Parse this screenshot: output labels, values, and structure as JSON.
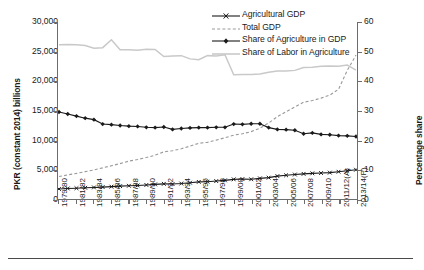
{
  "chart_data": {
    "type": "line",
    "title": "",
    "xlabel": "",
    "ylabel": "PKR (constant 2014) billions",
    "ylabel_right": "Percentage share",
    "ylim": [
      0,
      30000
    ],
    "ylim_right": [
      0,
      60
    ],
    "yticks": [
      "0",
      "5,000",
      "10,000",
      "15,000",
      "20,000",
      "25,000",
      "30,000"
    ],
    "ytick_values": [
      0,
      5000,
      10000,
      15000,
      20000,
      25000,
      30000
    ],
    "yticks_right": [
      "0",
      "10",
      "20",
      "30",
      "40",
      "50",
      "60"
    ],
    "ytick_values_right": [
      0,
      10,
      20,
      30,
      40,
      50,
      60
    ],
    "grid": false,
    "legend_position": "top-right",
    "categories": [
      "1979/80",
      "1980/81",
      "1981/82",
      "1982/83",
      "1983/84",
      "1984/85",
      "1985/86",
      "1986/87",
      "1987/88",
      "1988/89",
      "1989/90",
      "1990/91",
      "1991/92",
      "1992/93",
      "1993/94",
      "1994/95",
      "1995/96",
      "1996/97",
      "1997/98",
      "1998/99",
      "1999/00",
      "2000/01",
      "2001/02",
      "2002/03",
      "2003/04",
      "2004/05",
      "2005/06",
      "2006/07",
      "2007/08",
      "2008/09",
      "2009/10",
      "2010/11",
      "2011/12(A)",
      "2012/13",
      "2013/14(P)"
    ],
    "xtick_labels": [
      "1979/80",
      "1981/82",
      "1983/84",
      "1985/86",
      "1987/88",
      "1989/90",
      "1991/92",
      "1993/94",
      "1995/96",
      "1997/98",
      "1999/00",
      "2001/02",
      "2003/04",
      "2005/06",
      "2007/08",
      "2009/10",
      "2011/12(A)",
      "2013/14(P)"
    ],
    "series": [
      {
        "name": "Agricultural GDP",
        "axis": "left",
        "style": "solid-marker-x",
        "color": "#1a1a1a",
        "values": [
          1700,
          1790,
          1830,
          1900,
          1960,
          2020,
          2090,
          2180,
          2240,
          2300,
          2380,
          2480,
          2570,
          2530,
          2620,
          2760,
          2900,
          2930,
          3040,
          3160,
          3330,
          3380,
          3340,
          3500,
          3620,
          3880,
          4020,
          4150,
          4260,
          4350,
          4400,
          4470,
          4620,
          4780,
          4960
        ]
      },
      {
        "name": "Total GDP",
        "axis": "left",
        "style": "dashed",
        "color": "#9a9a9a",
        "values": [
          3800,
          4080,
          4340,
          4640,
          4920,
          5280,
          5640,
          6000,
          6420,
          6700,
          7020,
          7420,
          8000,
          8180,
          8520,
          8960,
          9440,
          9600,
          9980,
          10380,
          10820,
          11060,
          11420,
          12000,
          12880,
          13950,
          14800,
          15600,
          16400,
          16680,
          17100,
          17600,
          18600,
          21800,
          24400
        ]
      },
      {
        "name": "Share of Agriculture in GDP",
        "axis": "right",
        "style": "solid-marker-diamond",
        "color": "#1a1a1a",
        "values": [
          29.5,
          28.8,
          28.1,
          27.4,
          26.9,
          25.4,
          25.2,
          24.9,
          24.7,
          24.6,
          24.3,
          24.2,
          24.4,
          23.6,
          23.9,
          24.1,
          24.2,
          24.2,
          24.3,
          24.3,
          25.4,
          25.3,
          25.5,
          25.5,
          24.2,
          23.6,
          23.5,
          23.3,
          22.1,
          22.4,
          21.9,
          21.8,
          21.5,
          21.4,
          21.2
        ]
      },
      {
        "name": "Share of Labor in Agriculture",
        "axis": "right",
        "style": "solid-light",
        "color": "#c9c9c9",
        "values": [
          52.3,
          52.4,
          52.3,
          52.0,
          51.1,
          51.3,
          54.0,
          50.6,
          50.6,
          50.4,
          50.8,
          50.7,
          48.3,
          48.5,
          48.6,
          47.5,
          47.2,
          48.6,
          48.5,
          48.9,
          42.1,
          42.2,
          42.2,
          42.4,
          43.0,
          43.4,
          43.4,
          43.6,
          44.6,
          44.7,
          45.0,
          45.1,
          45.0,
          45.4,
          43.7
        ]
      }
    ],
    "legend": [
      {
        "label": "Agricultural GDP",
        "key": "line-x-marker"
      },
      {
        "label": "Total GDP",
        "key": "line-dashed"
      },
      {
        "label": "Share of Agriculture in GDP",
        "key": "line-diamond-marker"
      },
      {
        "label": "Share of Labor in Agriculture",
        "key": "line-light-solid"
      }
    ]
  }
}
